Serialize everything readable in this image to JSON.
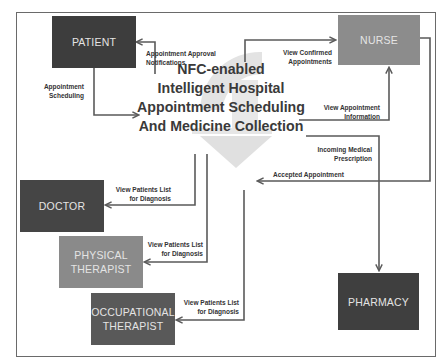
{
  "diagram": {
    "title": "NFC-enabled\nIntelligent Hospital\nAppointment Scheduling\nAnd Medicine Collection",
    "nodes": {
      "patient": {
        "label": "PATIENT",
        "color": "#3d3d3d"
      },
      "nurse": {
        "label": "NURSE",
        "color": "#8c8c8c"
      },
      "doctor": {
        "label": "DOCTOR",
        "color": "#454545"
      },
      "physical_therapist": {
        "label": "PHYSICAL\nTHERAPIST",
        "color": "#8a8a8a"
      },
      "occupational_therapist": {
        "label": "OCCUPATIONAL\nTHERAPIST",
        "color": "#595959"
      },
      "pharmacy": {
        "label": "PHARMACY",
        "color": "#3f3f3f"
      }
    },
    "edges": {
      "approval_notifications": "Appointment Approval\nNotifications",
      "appointment_scheduling": "Appointment\nScheduling",
      "view_confirmed": "View Confirmed\nAppointments",
      "view_appointment_info": "View Appointment\nInformation",
      "incoming_prescription": "Incoming Medical\nPrescription",
      "accepted_appointment": "Accepted Appointment",
      "doctor_patients": "View Patients List\nfor Diagnosis",
      "pt_patients": "View Patients List\nfor Diagnosis",
      "ot_patients": "View Patients List\nfor Diagnosis"
    },
    "colors": {
      "arrow": "#5a5a5a",
      "watermark": "#e2e2e2",
      "text_dark": "#333333"
    }
  }
}
